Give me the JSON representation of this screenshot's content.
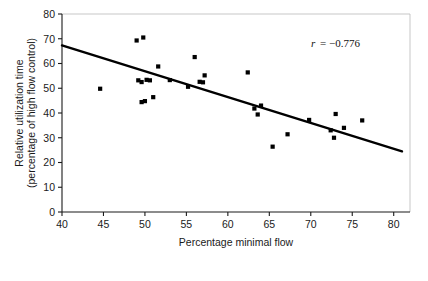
{
  "chart_data": {
    "type": "scatter",
    "title": "",
    "xlabel": "Percentage minimal flow",
    "ylabel_line1": "Relative utilization time",
    "ylabel_line2": "(percentage of high flow control)",
    "xlim": [
      40,
      81
    ],
    "ylim": [
      0,
      80
    ],
    "xticks": [
      40,
      45,
      50,
      55,
      60,
      65,
      70,
      75,
      80
    ],
    "yticks": [
      0,
      10,
      20,
      30,
      40,
      50,
      60,
      70,
      80
    ],
    "grid": false,
    "legend": "none",
    "annotation": "r = −0.776",
    "annotation_symbol": "r",
    "annotation_value": "= −0.776",
    "correlation": -0.776,
    "marker": "filled-square",
    "marker_color": "#000000",
    "fit_line": {
      "label": "least-squares regression line",
      "x_start": 40.0,
      "y_start": 67.3,
      "x_end": 81.0,
      "y_end": 24.5,
      "color": "#000000"
    },
    "points": [
      {
        "x": 44.6,
        "y": 49.8
      },
      {
        "x": 49.0,
        "y": 69.3
      },
      {
        "x": 49.8,
        "y": 70.5
      },
      {
        "x": 49.2,
        "y": 53.2
      },
      {
        "x": 49.6,
        "y": 52.5
      },
      {
        "x": 50.2,
        "y": 53.4
      },
      {
        "x": 50.6,
        "y": 53.2
      },
      {
        "x": 49.6,
        "y": 44.4
      },
      {
        "x": 50.0,
        "y": 44.8
      },
      {
        "x": 51.0,
        "y": 46.4
      },
      {
        "x": 51.6,
        "y": 58.8
      },
      {
        "x": 53.0,
        "y": 53.3
      },
      {
        "x": 55.2,
        "y": 50.6
      },
      {
        "x": 56.0,
        "y": 62.6
      },
      {
        "x": 56.6,
        "y": 52.6
      },
      {
        "x": 57.0,
        "y": 52.4
      },
      {
        "x": 57.2,
        "y": 55.2
      },
      {
        "x": 62.4,
        "y": 56.4
      },
      {
        "x": 63.2,
        "y": 41.8
      },
      {
        "x": 63.6,
        "y": 39.4
      },
      {
        "x": 64.0,
        "y": 43.0
      },
      {
        "x": 65.4,
        "y": 26.4
      },
      {
        "x": 67.2,
        "y": 31.4
      },
      {
        "x": 69.8,
        "y": 37.2
      },
      {
        "x": 72.4,
        "y": 33.0
      },
      {
        "x": 72.8,
        "y": 30.0
      },
      {
        "x": 73.0,
        "y": 39.6
      },
      {
        "x": 74.0,
        "y": 34.0
      },
      {
        "x": 76.2,
        "y": 37.0
      }
    ]
  }
}
